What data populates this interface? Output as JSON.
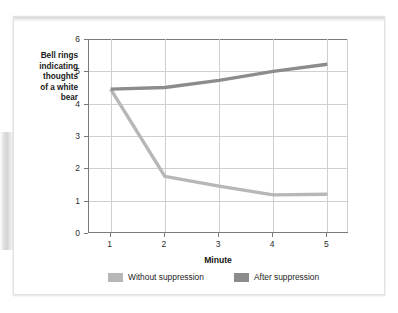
{
  "figure": {
    "background_color": "#ffffff",
    "card_border_color": "#e2e2e2"
  },
  "chart_data": {
    "type": "line",
    "title": "",
    "xlabel": "Minute",
    "ylabel": "Bell rings\nindicating\nthoughts\nof a white\nbear",
    "x": [
      1,
      2,
      3,
      4,
      5
    ],
    "xtick_labels": [
      "1",
      "2",
      "3",
      "4",
      "5"
    ],
    "ytick_labels": [
      "0",
      "1",
      "2",
      "3",
      "4",
      "5",
      "6"
    ],
    "xlim": [
      0.6,
      5.4
    ],
    "ylim": [
      0,
      6
    ],
    "grid": true,
    "legend_position": "bottom",
    "series": [
      {
        "name": "Without suppression",
        "color": "#b7b7b7",
        "values": [
          4.45,
          1.75,
          1.45,
          1.18,
          1.2
        ]
      },
      {
        "name": "After suppression",
        "color": "#8c8c8c",
        "values": [
          4.45,
          4.5,
          4.72,
          5.0,
          5.22
        ]
      }
    ]
  },
  "legend": {
    "entries": [
      {
        "label": "Without suppression",
        "color": "#b7b7b7"
      },
      {
        "label": "After suppression",
        "color": "#8c8c8c"
      }
    ]
  },
  "axis": {
    "y_title": "Bell rings\nindicating\nthoughts\nof a white\nbear",
    "x_title": "Minute"
  }
}
